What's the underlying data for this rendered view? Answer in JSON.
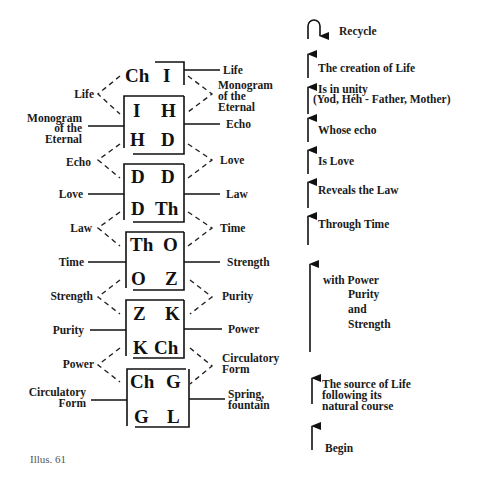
{
  "caption": "Illus. 61",
  "top_pair": {
    "left": "Ch",
    "right": "I"
  },
  "boxes": [
    {
      "top_left": "I",
      "top_right": "H",
      "bottom_left": "H",
      "bottom_right": "D"
    },
    {
      "top_left": "D",
      "top_right": "D",
      "bottom_left": "D",
      "bottom_right": "Th"
    },
    {
      "top_left": "Th",
      "top_right": "O",
      "bottom_left": "O",
      "bottom_right": "Z"
    },
    {
      "top_left": "Z",
      "top_right": "K",
      "bottom_left": "K",
      "bottom_right": "Ch"
    },
    {
      "top_left": "Ch",
      "top_right": "G",
      "bottom_left": "G",
      "bottom_right": "L"
    }
  ],
  "left_labels": {
    "life": "Life",
    "monogram_1": "Monogram",
    "monogram_2": "of the",
    "monogram_3": "Eternal",
    "echo": "Echo",
    "love": "Love",
    "law": "Law",
    "time": "Time",
    "strength": "Strength",
    "purity": "Purity",
    "power": "Power",
    "circ_1": "Circulatory",
    "circ_2": "Form"
  },
  "right_labels": {
    "life": "Life",
    "monogram_1": "Monogram",
    "monogram_2": "of the",
    "monogram_3": "Eternal",
    "echo": "Echo",
    "love": "Love",
    "law": "Law",
    "time": "Time",
    "strength": "Strength",
    "purity": "Purity",
    "power": "Power",
    "circ_1": "Circulatory",
    "circ_2": "Form",
    "spring_1": "Spring,",
    "spring_2": "fountain"
  },
  "sequence": [
    {
      "id": "recycle",
      "text": "Recycle",
      "icon": "recycle-loop-arrow"
    },
    {
      "id": "creation",
      "text": "The creation of Life",
      "icon": "up-arrow"
    },
    {
      "id": "unity",
      "text": "Is in unity",
      "text2": "(Yod, Héh - Father, Mother)",
      "icon": "up-arrow"
    },
    {
      "id": "whose_echo",
      "text": "Whose echo",
      "icon": "up-arrow"
    },
    {
      "id": "is_love",
      "text": "Is Love",
      "icon": "up-arrow"
    },
    {
      "id": "reveals_law",
      "text": "Reveals the Law",
      "icon": "up-arrow"
    },
    {
      "id": "through_time",
      "text": "Through Time",
      "icon": "up-arrow"
    },
    {
      "id": "with_power",
      "text": "with Power",
      "text2": "Purity",
      "text3": "and",
      "text4": "Strength",
      "icon": "up-arrow"
    },
    {
      "id": "source",
      "text": "The source of Life",
      "text2": "following its",
      "text3": "natural course",
      "icon": "up-arrow"
    },
    {
      "id": "begin",
      "text": "Begin",
      "icon": "up-arrow"
    }
  ]
}
